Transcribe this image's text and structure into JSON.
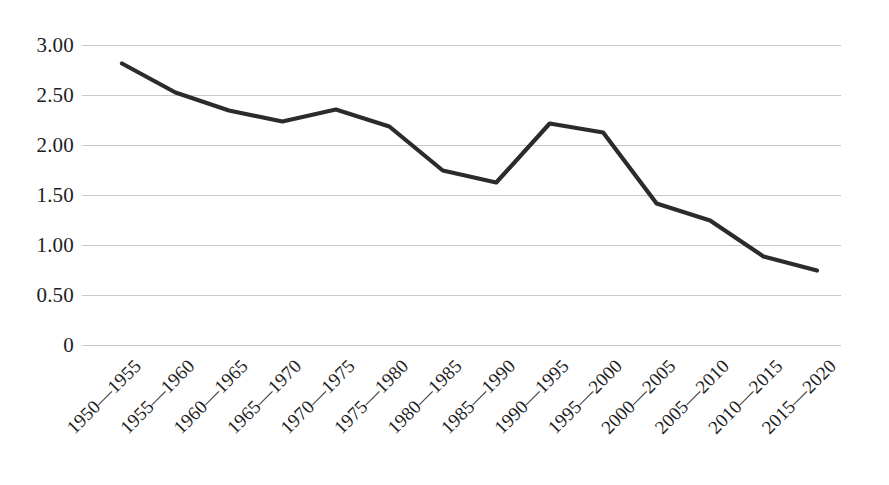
{
  "chart_data": {
    "type": "line",
    "title": "",
    "subtitle": "",
    "xlabel": "",
    "ylabel": "",
    "grid": true,
    "legend": false,
    "legend_position": "none",
    "line_color": "#2b2b2b",
    "grid_color": "#c8c8c8",
    "background_color": "#ffffff",
    "ylim": [
      0,
      3.0
    ],
    "y_ticks": [
      {
        "value": 3.0,
        "label": "3.00"
      },
      {
        "value": 2.5,
        "label": "2.50"
      },
      {
        "value": 2.0,
        "label": "2.00"
      },
      {
        "value": 1.5,
        "label": "1.50"
      },
      {
        "value": 1.0,
        "label": "1.00"
      },
      {
        "value": 0.5,
        "label": "0.50"
      },
      {
        "value": 0.0,
        "label": "0"
      }
    ],
    "categories": [
      "1950—1955",
      "1955—1960",
      "1960—1965",
      "1965—1970",
      "1970—1975",
      "1975—1980",
      "1980—1985",
      "1985—1990",
      "1990—1995",
      "1995—2000",
      "2000—2005",
      "2005—2010",
      "2010—2015",
      "2015—2020"
    ],
    "values": [
      2.82,
      2.53,
      2.35,
      2.24,
      2.36,
      2.19,
      1.75,
      1.63,
      2.22,
      2.13,
      1.42,
      1.25,
      0.89,
      0.75
    ],
    "series": [
      {
        "name": "",
        "values": [
          2.82,
          2.53,
          2.35,
          2.24,
          2.36,
          2.19,
          1.75,
          1.63,
          2.22,
          2.13,
          1.42,
          1.25,
          0.89,
          0.75
        ]
      }
    ]
  }
}
